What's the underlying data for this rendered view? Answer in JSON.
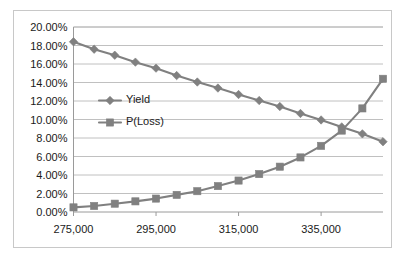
{
  "chart_data": {
    "type": "line",
    "title": "",
    "xlabel": "",
    "ylabel": "",
    "grid": "horizontal",
    "legend_position": "inside-left-center",
    "x": [
      275000,
      280000,
      285000,
      290000,
      295000,
      300000,
      305000,
      310000,
      315000,
      320000,
      325000,
      330000,
      335000,
      340000,
      345000,
      350000
    ],
    "xlim": [
      275000,
      350000
    ],
    "ylim": [
      0,
      0.2
    ],
    "xtick_labels": [
      "275,000",
      "295,000",
      "315,000",
      "335,000"
    ],
    "xtick_values": [
      275000,
      295000,
      315000,
      335000
    ],
    "ytick_labels": [
      "0.00%",
      "2.00%",
      "4.00%",
      "6.00%",
      "8.00%",
      "10.00%",
      "12.00%",
      "14.00%",
      "16.00%",
      "18.00%",
      "20.00%"
    ],
    "ytick_values": [
      0.0,
      0.02,
      0.04,
      0.06,
      0.08,
      0.1,
      0.12,
      0.14,
      0.16,
      0.18,
      0.2
    ],
    "series": [
      {
        "name": "Yield",
        "marker": "diamond",
        "color": "#808080",
        "values": [
          0.184,
          0.176,
          0.1695,
          0.162,
          0.1555,
          0.1475,
          0.1405,
          0.134,
          0.127,
          0.1205,
          0.114,
          0.1065,
          0.0995,
          0.092,
          0.0845,
          0.076
        ]
      },
      {
        "name": "P(Loss)",
        "marker": "square",
        "color": "#808080",
        "values": [
          0.005,
          0.0065,
          0.009,
          0.0115,
          0.0145,
          0.0185,
          0.0225,
          0.028,
          0.034,
          0.041,
          0.049,
          0.059,
          0.0715,
          0.088,
          0.112,
          0.144
        ]
      }
    ]
  },
  "legend": {
    "items": [
      {
        "label": "Yield",
        "marker": "diamond",
        "color": "#808080"
      },
      {
        "label": "P(Loss)",
        "marker": "square",
        "color": "#808080"
      }
    ]
  },
  "colors": {
    "series_gray": "#808080",
    "gridline": "#b0b0b0",
    "axis": "#9a9a9a",
    "frame_border": "#c8c8c8",
    "text": "#1a1a1a",
    "background": "#ffffff"
  }
}
